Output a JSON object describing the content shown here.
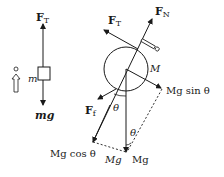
{
  "diagram": {
    "colors": {
      "ink": "#1a1a1a",
      "background": "#ffffff"
    },
    "left_body": {
      "mass_label": "m",
      "tension": {
        "symbol": "F",
        "subscript": "T"
      },
      "weight": {
        "text": "mg"
      },
      "motion_icon": "up-arrow-with-dot-icon"
    },
    "right_body": {
      "mass_label": "M",
      "normal": {
        "symbol": "F",
        "subscript": "N"
      },
      "tension": {
        "symbol": "F",
        "subscript": "T"
      },
      "friction": {
        "symbol": "F",
        "subscript": "f"
      },
      "weight_components": {
        "sin": "Mg sin θ",
        "cos": "Mg cos θ",
        "weight": "Mg",
        "weight_dup": "Mg"
      },
      "angle_1": "θ",
      "angle_2": "θ",
      "motion_icon": "diagonal-arrow-with-dot-icon"
    }
  }
}
